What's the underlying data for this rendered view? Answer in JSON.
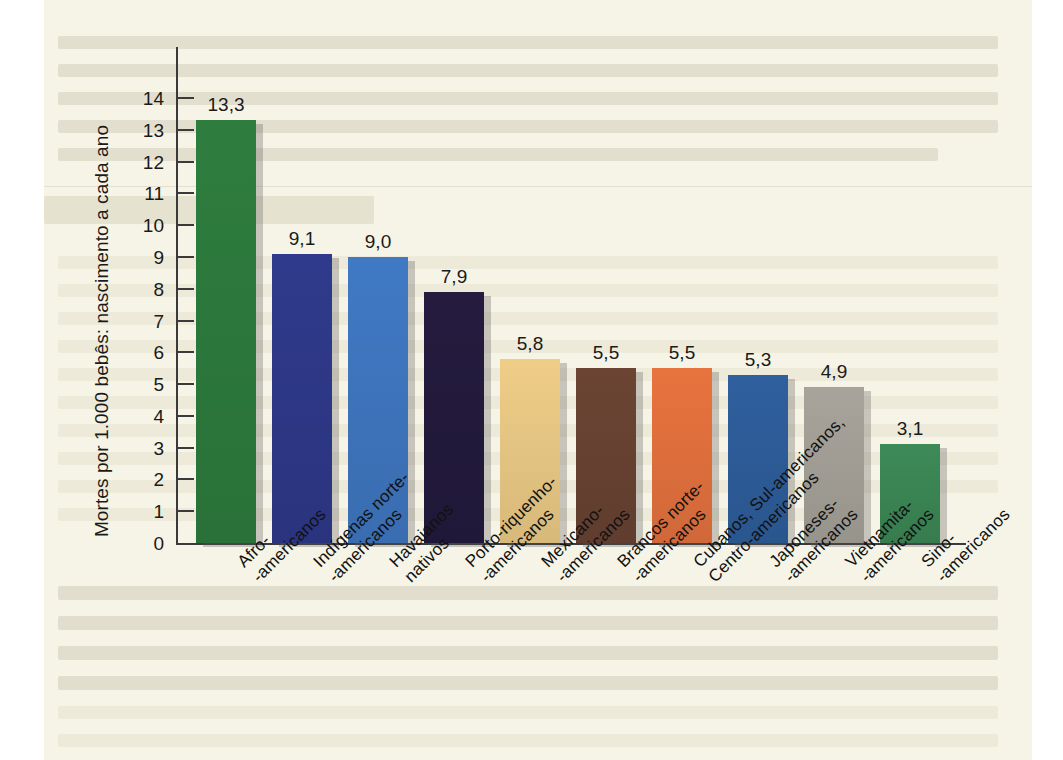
{
  "figure": {
    "background_color": "#f6f4e6",
    "axis_color": "#3a3a3a"
  },
  "chart_data": {
    "type": "bar",
    "title": "",
    "xlabel": "",
    "ylabel": "Mortes por 1.000 bebês: nascimento a cada ano",
    "ylim": [
      0,
      14
    ],
    "grid": false,
    "legend": "none",
    "ytick_labels": [
      "14",
      "13",
      "12",
      "11",
      "10",
      "9",
      "8",
      "7",
      "6",
      "5",
      "4",
      "3",
      "2",
      "1",
      "0"
    ],
    "ytick_values": [
      14,
      13,
      12,
      11,
      10,
      9,
      8,
      7,
      6,
      5,
      4,
      3,
      2,
      1,
      0
    ],
    "categories": [
      "Afro-\n-americanos",
      "Indígenas norte-\n-americanos",
      "Havaianos\nnativos",
      "Porto-riquenho-\n-americanos",
      "Mexicano-\n-americanos",
      "Brancos norte-\n-americanos",
      "Cubanos, Sul-americanos,\nCentro-americanos",
      "Japoneses-\n-americanos",
      "Vietnamita-\n-americanos",
      "Sino-\n-americanos"
    ],
    "values": [
      13.3,
      9.1,
      9.0,
      7.9,
      5.8,
      5.5,
      5.5,
      5.3,
      4.9,
      3.1
    ],
    "value_labels": [
      "13,3",
      "9,1",
      "9,0",
      "7,9",
      "5,8",
      "5,5",
      "5,5",
      "5,3",
      "4,9",
      "3,1"
    ],
    "colors": [
      "#2e7d3e",
      "#2f3a8c",
      "#4079c4",
      "#241b3e",
      "#efcd87",
      "#6b4433",
      "#e8733f",
      "#2f5f9e",
      "#a8a49c",
      "#3d8a57"
    ]
  }
}
